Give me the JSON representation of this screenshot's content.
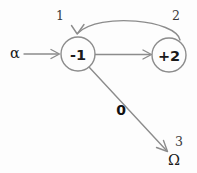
{
  "diagram": {
    "type": "state-transition-graph",
    "background_color": "#fdfdfd",
    "stroke_color": "#8c8c8c",
    "text_color": "#1a1a1a",
    "nodes": [
      {
        "id": "n1",
        "label": "-1",
        "index": "1",
        "cx": 78,
        "cy": 54,
        "r": 17
      },
      {
        "id": "n2",
        "label": "+2",
        "index": "2",
        "cx": 169,
        "cy": 55,
        "r": 17
      }
    ],
    "terminals": [
      {
        "id": "start",
        "label": "α",
        "x": 15,
        "y": 53
      },
      {
        "id": "omega",
        "label": "Ω",
        "index": "3",
        "x": 174,
        "y": 160
      }
    ],
    "edges": [
      {
        "id": "e-start",
        "from": "start",
        "to": "n1",
        "label": "",
        "shape": "straight"
      },
      {
        "id": "e-forward",
        "from": "n1",
        "to": "n2",
        "label": "",
        "shape": "straight"
      },
      {
        "id": "e-back",
        "from": "n2",
        "to": "n1",
        "label": "",
        "shape": "curved"
      },
      {
        "id": "e-omega",
        "from": "n1",
        "to": "omega",
        "label": "0",
        "shape": "straight"
      }
    ]
  }
}
